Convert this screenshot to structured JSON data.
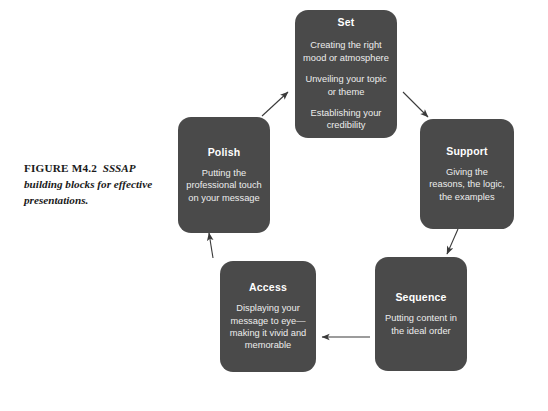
{
  "figure": {
    "label": "FIGURE M4.2",
    "caption": "SSSAP building blocks for effective presentations."
  },
  "colors": {
    "node_fill": "#4a4a4a",
    "node_title_text": "#ffffff",
    "node_body_text": "#ededed",
    "arrow": "#3a3a3a",
    "background": "#ffffff",
    "caption_text": "#1a1a1a"
  },
  "diagram": {
    "type": "cycle",
    "nodes": [
      {
        "id": "set",
        "title": "Set",
        "lines": [
          "Creating the right mood or atmosphere",
          "Unveiling your topic or theme",
          "Establishing your credibility"
        ]
      },
      {
        "id": "support",
        "title": "Support",
        "lines": [
          "Giving the reasons, the logic, the examples"
        ]
      },
      {
        "id": "sequence",
        "title": "Sequence",
        "lines": [
          "Putting content in the ideal order"
        ]
      },
      {
        "id": "access",
        "title": "Access",
        "lines": [
          "Displaying your message to eye—making it vivid and memorable"
        ]
      },
      {
        "id": "polish",
        "title": "Polish",
        "lines": [
          "Putting the professional touch on your message"
        ]
      }
    ],
    "arrows": [
      {
        "id": "polish-to-set",
        "from": "polish",
        "to": "set",
        "direction": "up-right"
      },
      {
        "id": "set-to-support",
        "from": "set",
        "to": "support",
        "direction": "down-right"
      },
      {
        "id": "support-to-sequence",
        "from": "support",
        "to": "sequence",
        "direction": "down"
      },
      {
        "id": "sequence-to-access",
        "from": "sequence",
        "to": "access",
        "direction": "left"
      },
      {
        "id": "access-to-polish",
        "from": "access",
        "to": "polish",
        "direction": "up"
      }
    ]
  }
}
